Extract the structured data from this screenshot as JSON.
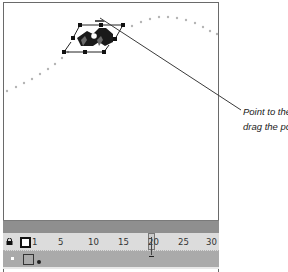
{
  "callout": {
    "line1": "Point to the",
    "line2": "drag the poi"
  },
  "timeline": {
    "frame_labels": [
      "1",
      "5",
      "10",
      "15",
      "20",
      "25",
      "30"
    ],
    "current_frame": "20"
  },
  "colors": {
    "stage_bg": "#ffffff",
    "timeline_header": "#8f8f8f",
    "ruler_bg": "#dcdcdc",
    "layer_bg": "#aaaaaa"
  }
}
